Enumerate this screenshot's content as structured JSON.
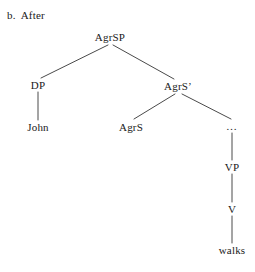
{
  "caption": {
    "letter": "b.",
    "text": "After"
  },
  "diagram": {
    "type": "syntax-tree",
    "line_color": "#4a4a4a",
    "background": "#ffffff",
    "nodes": [
      {
        "id": "agrsp",
        "label": "AgrSP",
        "x": 110,
        "y": 37
      },
      {
        "id": "dp",
        "label": "DP",
        "x": 38,
        "y": 85
      },
      {
        "id": "john",
        "label": "John",
        "x": 38,
        "y": 127
      },
      {
        "id": "agrsbar",
        "label": "AgrS’",
        "x": 178,
        "y": 86
      },
      {
        "id": "agrs",
        "label": "AgrS",
        "x": 131,
        "y": 127
      },
      {
        "id": "dots",
        "label": "…",
        "x": 232,
        "y": 126
      },
      {
        "id": "vp",
        "label": "VP",
        "x": 232,
        "y": 167
      },
      {
        "id": "v",
        "label": "V",
        "x": 232,
        "y": 209
      },
      {
        "id": "walks",
        "label": "walks",
        "x": 232,
        "y": 250
      }
    ],
    "edges": [
      {
        "id": "agrsp-dp",
        "from": "AgrSP",
        "to": "DP",
        "x1": 108,
        "y1": 45,
        "x2": 41,
        "y2": 78
      },
      {
        "id": "agrsp-agrsbar",
        "from": "AgrSP",
        "to": "AgrS’",
        "x1": 113,
        "y1": 45,
        "x2": 174,
        "y2": 79
      },
      {
        "id": "dp-john",
        "from": "DP",
        "to": "John",
        "x1": 38,
        "y1": 92,
        "x2": 38,
        "y2": 120
      },
      {
        "id": "agrsbar-agrs",
        "from": "AgrS’",
        "to": "AgrS",
        "x1": 175,
        "y1": 94,
        "x2": 134,
        "y2": 119
      },
      {
        "id": "agrsbar-dots",
        "from": "AgrS’",
        "to": "…",
        "x1": 182,
        "y1": 94,
        "x2": 231,
        "y2": 119
      },
      {
        "id": "dots-vp",
        "from": "…",
        "to": "VP",
        "x1": 232,
        "y1": 133,
        "x2": 232,
        "y2": 160
      },
      {
        "id": "vp-v",
        "from": "VP",
        "to": "V",
        "x1": 232,
        "y1": 174,
        "x2": 232,
        "y2": 202
      },
      {
        "id": "v-walks",
        "from": "V",
        "to": "walks",
        "x1": 232,
        "y1": 216,
        "x2": 232,
        "y2": 243
      }
    ]
  }
}
